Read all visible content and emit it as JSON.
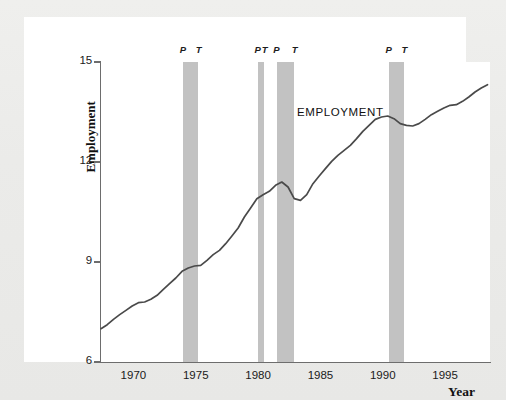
{
  "chart_data": {
    "type": "line",
    "title": "",
    "series_label": "EMPLOYMENT",
    "xlabel": "Year",
    "ylabel": "Employment\n(millions of people)",
    "ylabel_line1": "Employment",
    "ylabel_line2": "(millions of people)",
    "xlim": [
      1967.4,
      1998.6
    ],
    "ylim": [
      6,
      15
    ],
    "yticks": [
      6,
      9,
      12,
      15
    ],
    "ytick_labels": [
      "6",
      "9",
      "12",
      "15"
    ],
    "xticks": [
      1970,
      1975,
      1980,
      1985,
      1990,
      1995
    ],
    "xtick_labels": [
      "1970",
      "1975",
      "1980",
      "1985",
      "1990",
      "1995"
    ],
    "grid": false,
    "legend": "none",
    "line_color": "#4a4a4a",
    "band_color": "#c2c2c2",
    "recession_bands": [
      {
        "peak_label": "P",
        "trough_label": "T",
        "peak_year": 1974.0,
        "trough_year": 1975.2
      },
      {
        "peak_label": "P",
        "trough_label": "T",
        "peak_year": 1980.0,
        "trough_year": 1980.5
      },
      {
        "peak_label": "P",
        "trough_label": "T",
        "peak_year": 1981.5,
        "trough_year": 1982.9
      },
      {
        "peak_label": "P",
        "trough_label": "T",
        "peak_year": 1990.5,
        "trough_year": 1991.7
      }
    ],
    "x": [
      1967.4,
      1967.9,
      1968.4,
      1968.9,
      1969.4,
      1969.9,
      1970.4,
      1970.9,
      1971.4,
      1971.9,
      1972.4,
      1972.9,
      1973.4,
      1973.9,
      1974.4,
      1974.9,
      1975.4,
      1975.9,
      1976.4,
      1976.9,
      1977.4,
      1977.9,
      1978.4,
      1978.9,
      1979.4,
      1979.9,
      1980.4,
      1980.9,
      1981.4,
      1981.9,
      1982.4,
      1982.9,
      1983.4,
      1983.9,
      1984.4,
      1984.9,
      1985.4,
      1985.9,
      1986.4,
      1986.9,
      1987.4,
      1987.9,
      1988.4,
      1988.9,
      1989.4,
      1989.9,
      1990.4,
      1990.9,
      1991.4,
      1991.9,
      1992.4,
      1992.9,
      1993.4,
      1993.9,
      1994.4,
      1994.9,
      1995.4,
      1995.9,
      1996.4,
      1996.9,
      1997.4,
      1997.9,
      1998.4
    ],
    "values": [
      7.0,
      7.12,
      7.28,
      7.42,
      7.55,
      7.68,
      7.78,
      7.8,
      7.88,
      8.0,
      8.18,
      8.35,
      8.52,
      8.72,
      8.82,
      8.88,
      8.9,
      9.05,
      9.22,
      9.35,
      9.55,
      9.78,
      10.02,
      10.35,
      10.62,
      10.9,
      11.02,
      11.12,
      11.3,
      11.4,
      11.25,
      10.9,
      10.85,
      11.02,
      11.35,
      11.58,
      11.8,
      12.02,
      12.2,
      12.35,
      12.5,
      12.7,
      12.92,
      13.1,
      13.28,
      13.35,
      13.38,
      13.3,
      13.15,
      13.1,
      13.08,
      13.15,
      13.28,
      13.42,
      13.52,
      13.62,
      13.7,
      13.72,
      13.82,
      13.95,
      14.1,
      14.22,
      14.32
    ],
    "data_note": "Employment in millions of people, 1967-1998; shaded vertical bands mark recessions between business-cycle peaks (P) and troughs (T)."
  },
  "labels": {
    "series": "EMPLOYMENT",
    "x_title": "Year",
    "y_title_line1": "Employment",
    "y_title_line2": "(millions of people)"
  }
}
